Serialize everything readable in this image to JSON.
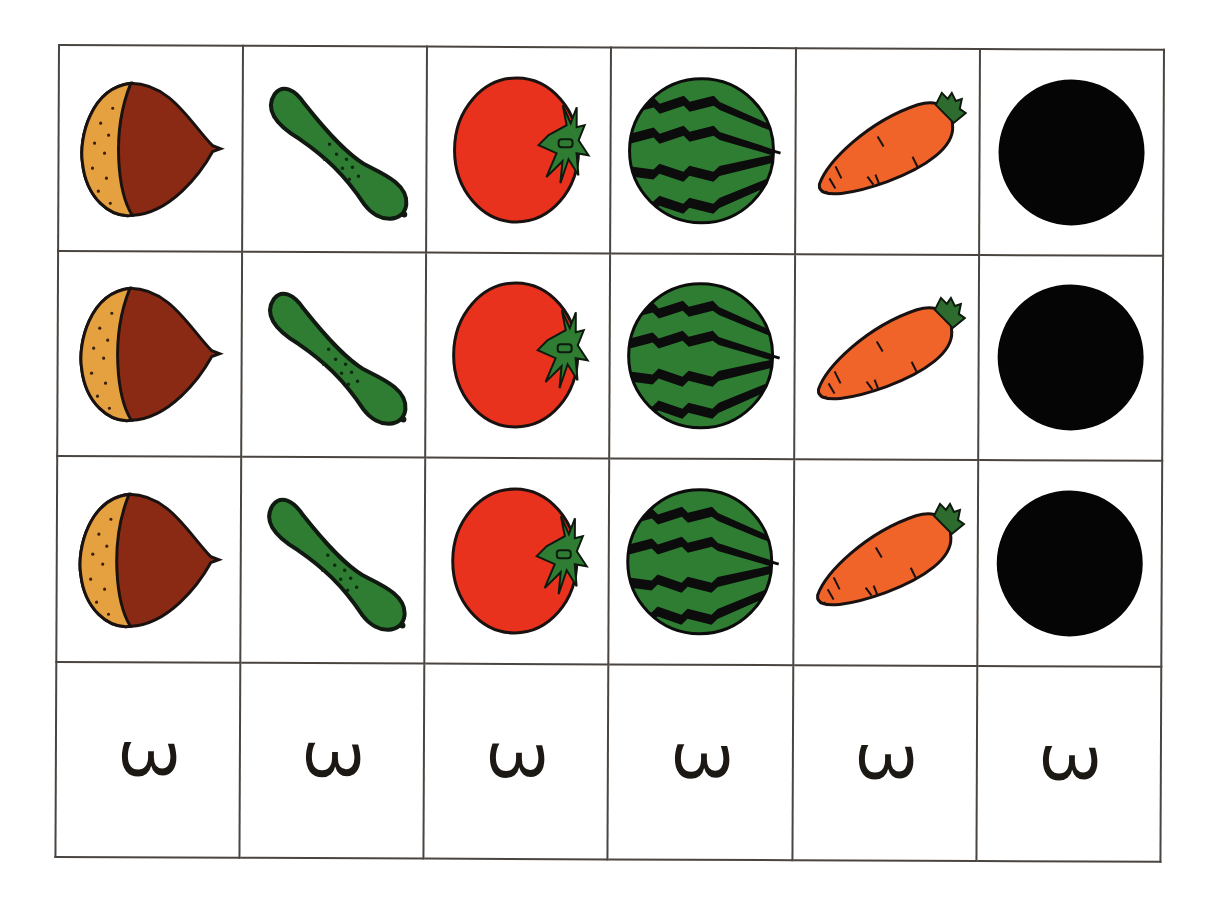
{
  "worksheet": {
    "columns": [
      {
        "item": "chestnut",
        "icon": "chestnut-icon",
        "count_label": "3",
        "colors": {
          "shell": "#8b2a14",
          "base": "#e5a040",
          "outline": "#1a1210"
        }
      },
      {
        "item": "cucumber",
        "icon": "cucumber-icon",
        "count_label": "3",
        "colors": {
          "body": "#2e7d32",
          "outline": "#101a10"
        }
      },
      {
        "item": "tomato",
        "icon": "tomato-icon",
        "count_label": "3",
        "colors": {
          "body": "#e8321e",
          "leaf": "#2e7d32",
          "outline": "#1a1210"
        }
      },
      {
        "item": "watermelon",
        "icon": "watermelon-icon",
        "count_label": "3",
        "colors": {
          "body": "#2e7d32",
          "stripe": "#0c0c0c"
        }
      },
      {
        "item": "carrot",
        "icon": "carrot-icon",
        "count_label": "3",
        "colors": {
          "body": "#f0642a",
          "leaf": "#2e6b2e",
          "outline": "#1a1210"
        }
      },
      {
        "item": "black-circle",
        "icon": "black-circle-icon",
        "count_label": "3",
        "colors": {
          "body": "#050505"
        }
      }
    ],
    "rows_of_pictures": 3,
    "grid_line_color": "#4a4540"
  }
}
